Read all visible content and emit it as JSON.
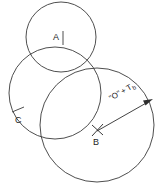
{
  "diagram": {
    "background_color": "#ffffff",
    "stroke_color": "#3a3a3a",
    "label_color": "#1c1c1c",
    "circles": [
      {
        "id": "top-circle",
        "name": "circle-a",
        "cx": 61,
        "cy": 37,
        "r": 35
      },
      {
        "id": "left-circle",
        "name": "circle-c",
        "cx": 55,
        "cy": 93,
        "r": 46
      },
      {
        "id": "large-circle",
        "name": "circle-b",
        "cx": 97,
        "cy": 125,
        "r": 57
      }
    ],
    "points": [
      {
        "id": "point-a",
        "label": "A",
        "x": 57,
        "y": 37,
        "marker": "tick"
      },
      {
        "id": "point-c",
        "label": "C",
        "x": 20,
        "y": 120,
        "marker": "tick"
      },
      {
        "id": "point-b",
        "label": "B",
        "x": 97,
        "y": 137,
        "marker": "cross"
      }
    ],
    "radius_arrow": {
      "label_quoted": "\"O\"",
      "label_plus": "+",
      "label_term": "T",
      "label_subscript": "b",
      "from_x": 97,
      "from_y": 131,
      "to_x": 152,
      "to_y": 100
    }
  }
}
